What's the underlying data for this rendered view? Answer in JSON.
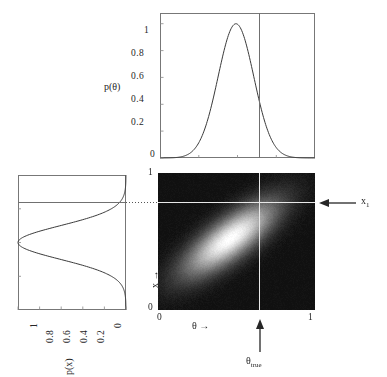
{
  "figure": {
    "name": "bayesian-joint-marginal-figure",
    "background_color": "#ffffff",
    "axis_color": "#777777",
    "curve_color": "#3a3a3a",
    "crosshair_color": "#e8e8e8",
    "heatmap_dark": "#121212",
    "heatmap_bright": "#ffffff"
  },
  "top_panel": {
    "name": "marginal-prior-theta",
    "ylabel": "p(θ)",
    "yticks": [
      "0",
      "0.2",
      "0.4",
      "0.6",
      "0.8",
      "1"
    ],
    "ytick_values": [
      0,
      0.2,
      0.4,
      0.6,
      0.8,
      1
    ],
    "ylim": [
      0,
      1.08
    ],
    "xlim": [
      0,
      1
    ],
    "vline_label": "θtrue",
    "vline_x": 0.635,
    "curve": {
      "type": "line",
      "distribution": "gaussian",
      "mean": 0.49,
      "sigma": 0.115,
      "peak": 1.0
    }
  },
  "left_panel": {
    "name": "marginal-likelihood-x",
    "xlabel": "p(x)",
    "xticks": [
      "1",
      "0.8",
      "0.6",
      "0.4",
      "0.2",
      "0"
    ],
    "xtick_values": [
      1,
      0.8,
      0.6,
      0.4,
      0.2,
      0
    ],
    "xlim": [
      1,
      0
    ],
    "ylim": [
      0,
      1
    ],
    "hline_y": 0.79,
    "curve": {
      "type": "line",
      "distribution": "gaussian",
      "mean": 0.5,
      "sigma": 0.125,
      "peak": 1.0
    }
  },
  "main_panel": {
    "name": "joint-density-heatmap",
    "xlabel": "θ →",
    "ylabel": "x →",
    "xticks": [
      "0",
      "1"
    ],
    "yticks": [
      "0",
      "1"
    ],
    "xlim": [
      0,
      1
    ],
    "ylim": [
      0,
      1
    ],
    "annotations": {
      "right_arrow_label": "x",
      "right_arrow_sub": "1",
      "bottom_arrow_label": "θ",
      "bottom_arrow_sub": "true"
    },
    "crosshair": {
      "vertical_x": 0.635,
      "horizontal_y": 0.79
    },
    "chart_data": {
      "type": "heatmap",
      "description": "Joint probability density p(x,theta): elongated 2D Gaussian tilted ~45 degrees showing positive correlation between theta and x",
      "center_x": 0.46,
      "center_y": 0.52,
      "sigma_major": 0.2,
      "sigma_minor": 0.072,
      "rotation_deg": 42,
      "colormap": "grayscale",
      "vmin": 0,
      "vmax": 1
    }
  },
  "chart_data": {
    "type": "heatmap",
    "title": "",
    "xlabel": "θ →",
    "ylabel": "x →",
    "xlim": [
      0,
      1
    ],
    "ylim": [
      0,
      1
    ],
    "grid": false,
    "legend": "none",
    "joint": {
      "center": [
        0.46,
        0.52
      ],
      "sigma_major": 0.2,
      "sigma_minor": 0.072,
      "rotation_deg": 42,
      "colormap": "gray"
    },
    "marginal_theta": {
      "type": "line",
      "x": [
        0.0,
        0.05,
        0.1,
        0.15,
        0.2,
        0.25,
        0.3,
        0.35,
        0.4,
        0.45,
        0.49,
        0.55,
        0.6,
        0.635,
        0.7,
        0.75,
        0.8,
        0.85,
        0.9,
        0.95,
        1.0
      ],
      "y": [
        0.0,
        0.001,
        0.004,
        0.013,
        0.038,
        0.098,
        0.216,
        0.406,
        0.652,
        0.893,
        1.0,
        0.905,
        0.697,
        0.557,
        0.276,
        0.145,
        0.063,
        0.023,
        0.007,
        0.002,
        0.0
      ],
      "ylabel": "p(θ)",
      "ylim": [
        0,
        1.08
      ]
    },
    "marginal_x": {
      "type": "line",
      "x": [
        0.0,
        0.05,
        0.1,
        0.15,
        0.2,
        0.25,
        0.3,
        0.35,
        0.4,
        0.45,
        0.5,
        0.55,
        0.6,
        0.65,
        0.7,
        0.75,
        0.79,
        0.85,
        0.9,
        0.95,
        1.0
      ],
      "y": [
        0.0,
        0.002,
        0.007,
        0.021,
        0.055,
        0.13,
        0.265,
        0.459,
        0.696,
        0.923,
        1.0,
        0.923,
        0.696,
        0.459,
        0.265,
        0.13,
        0.067,
        0.021,
        0.007,
        0.002,
        0.0
      ],
      "xlabel": "p(x)",
      "xlim": [
        1,
        0
      ]
    }
  }
}
